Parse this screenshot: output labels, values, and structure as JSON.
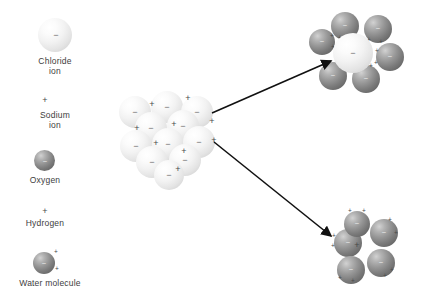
{
  "diagram": {
    "colors": {
      "background": "#ffffff",
      "text": "#3d3d3d",
      "chloride_sphere": "#f0f0f0",
      "oxygen_sphere": "#7b7b7b",
      "arrow": "#111111",
      "charge_text": "#4a4a4a"
    }
  },
  "legend": {
    "items": [
      {
        "id": "chloride-ion",
        "label": "Chloride\nion",
        "symbol": "−",
        "swatch": "large-pale-sphere",
        "x": 38,
        "y": 18,
        "size": 34,
        "label_x": 20,
        "label_y": 56
      },
      {
        "id": "sodium-ion",
        "label": "Sodium\nion",
        "symbol": "+",
        "swatch": "plus-sign-only",
        "x": 44,
        "y": 96,
        "size": 0,
        "label_x": 20,
        "label_y": 110
      },
      {
        "id": "oxygen",
        "label": "Oxygen",
        "symbol": "−",
        "swatch": "dark-sphere",
        "x": 44,
        "y": 150,
        "size": 21,
        "label_x": 20,
        "label_y": 175
      },
      {
        "id": "hydrogen",
        "label": "Hydrogen",
        "symbol": "+",
        "swatch": "plus-sign-only",
        "x": 44,
        "y": 207,
        "size": 0,
        "label_x": 16,
        "label_y": 218
      },
      {
        "id": "water-molecule",
        "label": "Water molecule",
        "symbol": "−",
        "swatch": "dark-sphere-with-two-hydrogens",
        "x": 43,
        "y": 252,
        "size": 22,
        "label_x": 10,
        "label_y": 278
      }
    ]
  },
  "crystal": {
    "name": "sodium-chloride-crystal-lattice",
    "spheres": [
      {
        "cx": 135,
        "cy": 112,
        "r": 16,
        "charge": "−"
      },
      {
        "cx": 167,
        "cy": 107,
        "r": 16,
        "charge": "−"
      },
      {
        "cx": 197,
        "cy": 112,
        "r": 16,
        "charge": "−"
      },
      {
        "cx": 151,
        "cy": 128,
        "r": 16,
        "charge": "−"
      },
      {
        "cx": 183,
        "cy": 126,
        "r": 16,
        "charge": "−"
      },
      {
        "cx": 136,
        "cy": 146,
        "r": 16,
        "charge": "−"
      },
      {
        "cx": 168,
        "cy": 144,
        "r": 16,
        "charge": "−"
      },
      {
        "cx": 199,
        "cy": 142,
        "r": 16,
        "charge": "−"
      },
      {
        "cx": 152,
        "cy": 162,
        "r": 16,
        "charge": "−"
      },
      {
        "cx": 185,
        "cy": 160,
        "r": 16,
        "charge": "−"
      },
      {
        "cx": 169,
        "cy": 175,
        "r": 15,
        "charge": "−"
      }
    ],
    "sodium_charges": [
      {
        "x": 152,
        "y": 104,
        "symbol": "+"
      },
      {
        "x": 188,
        "y": 98,
        "symbol": "+"
      },
      {
        "x": 212,
        "y": 121,
        "symbol": "+"
      },
      {
        "x": 137,
        "y": 128,
        "symbol": "+"
      },
      {
        "x": 174,
        "y": 124,
        "symbol": "+"
      },
      {
        "x": 156,
        "y": 143,
        "symbol": "+"
      },
      {
        "x": 214,
        "y": 140,
        "symbol": "+"
      },
      {
        "x": 184,
        "y": 151,
        "symbol": "+"
      },
      {
        "x": 178,
        "y": 169,
        "symbol": "+"
      }
    ]
  },
  "hydrated_chloride": {
    "name": "hydrated-chloride-ion",
    "center": {
      "cx": 353,
      "cy": 53,
      "r": 20,
      "charge": "−"
    },
    "waters": [
      {
        "cx": 322,
        "cy": 42,
        "r": 13,
        "charge": "−",
        "h": [
          {
            "x": 333,
            "y": 48
          },
          {
            "x": 332,
            "y": 37
          }
        ]
      },
      {
        "cx": 345,
        "cy": 26,
        "r": 14,
        "charge": "−",
        "h": [
          {
            "x": 340,
            "y": 39
          },
          {
            "x": 353,
            "y": 39
          }
        ]
      },
      {
        "cx": 378,
        "cy": 29,
        "r": 14,
        "charge": "−",
        "h": [
          {
            "x": 369,
            "y": 41
          },
          {
            "x": 381,
            "y": 43
          }
        ]
      },
      {
        "cx": 390,
        "cy": 57,
        "r": 14,
        "charge": "−",
        "h": [
          {
            "x": 377,
            "y": 52
          },
          {
            "x": 376,
            "y": 64
          }
        ]
      },
      {
        "cx": 366,
        "cy": 79,
        "r": 14,
        "charge": "−",
        "h": [
          {
            "x": 358,
            "y": 68
          },
          {
            "x": 371,
            "y": 67
          }
        ]
      },
      {
        "cx": 333,
        "cy": 76,
        "r": 14,
        "charge": "−",
        "h": [
          {
            "x": 341,
            "y": 65
          },
          {
            "x": 346,
            "y": 70
          }
        ]
      }
    ]
  },
  "hydrated_sodium": {
    "name": "hydrated-sodium-ion",
    "center": {
      "x": 357,
      "y": 245,
      "symbol": "+"
    },
    "waters": [
      {
        "cx": 348,
        "cy": 243,
        "r": 14,
        "charge": "−",
        "h": [
          {
            "x": 334,
            "y": 237
          },
          {
            "x": 333,
            "y": 247
          }
        ]
      },
      {
        "cx": 357,
        "cy": 224,
        "r": 13,
        "charge": "−",
        "h": [
          {
            "x": 350,
            "y": 212
          },
          {
            "x": 364,
            "y": 212
          }
        ]
      },
      {
        "cx": 384,
        "cy": 233,
        "r": 14,
        "charge": "−",
        "h": [
          {
            "x": 390,
            "y": 221
          },
          {
            "x": 396,
            "y": 234
          }
        ]
      },
      {
        "cx": 381,
        "cy": 263,
        "r": 14,
        "charge": "−",
        "h": [
          {
            "x": 392,
            "y": 271
          },
          {
            "x": 385,
            "y": 277
          }
        ]
      },
      {
        "cx": 351,
        "cy": 270,
        "r": 14,
        "charge": "−",
        "h": [
          {
            "x": 340,
            "y": 279
          },
          {
            "x": 353,
            "y": 282
          }
        ]
      }
    ]
  },
  "arrows": [
    {
      "name": "arrow-to-chloride",
      "x1": 212,
      "y1": 113,
      "x2": 331,
      "y2": 61
    },
    {
      "name": "arrow-to-sodium",
      "x1": 214,
      "y1": 142,
      "x2": 331,
      "y2": 236
    }
  ]
}
